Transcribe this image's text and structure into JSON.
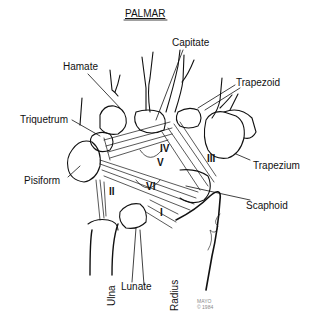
{
  "title": "PALMAR",
  "bones": {
    "capitate": "Capitate",
    "hamate": "Hamate",
    "trapezoid": "Trapezoid",
    "triquetrum": "Triquetrum",
    "trapezium": "Trapezium",
    "pisiform": "Pisiform",
    "scaphoid": "Scaphoid",
    "lunate": "Lunate",
    "ulna": "Ulna",
    "radius": "Radius"
  },
  "ligaments": [
    "I",
    "II",
    "III",
    "IV",
    "V",
    "VI"
  ],
  "signature": {
    "line1": "MAYO",
    "line2": "© 1984"
  }
}
